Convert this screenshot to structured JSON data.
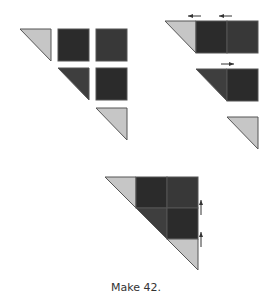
{
  "caption": "Make 42.",
  "colors": {
    "light": "#c6c6c6",
    "dark_square_a": "#2b2b2b",
    "dark_square_b": "#383838",
    "dark_triangle": "#3e3e3e",
    "stroke": "#555555",
    "arrow": "#333333"
  },
  "panels": [
    {
      "name": "loose-pieces",
      "description": "Light triangle, two dark squares; dark triangle, dark square; light triangle"
    },
    {
      "name": "sewn-rows",
      "description": "Rows sewn with pressing direction arrows (left, left, right)"
    },
    {
      "name": "assembled-unit",
      "description": "Rows joined into half-square staircase unit, seams pressed up"
    }
  ]
}
